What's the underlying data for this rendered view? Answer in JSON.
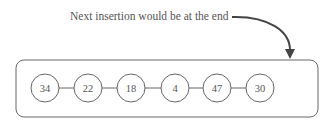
{
  "annotation": {
    "text": "Next insertion would be at the end"
  },
  "list": {
    "nodes": [
      {
        "value": "34"
      },
      {
        "value": "22"
      },
      {
        "value": "18"
      },
      {
        "value": "4"
      },
      {
        "value": "47"
      },
      {
        "value": "30"
      }
    ]
  },
  "colors": {
    "stroke": "#555555",
    "arrow": "#444444",
    "text": "#555555"
  }
}
